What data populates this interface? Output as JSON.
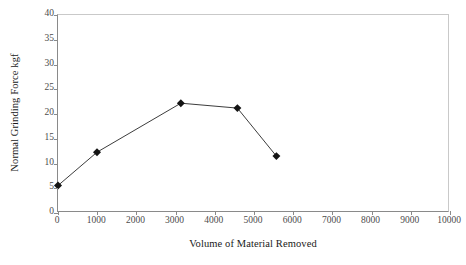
{
  "chart_data": {
    "type": "line",
    "title": "",
    "subtitle": "",
    "xlabel": "Volume of Material Removed",
    "ylabel": "Normal Grinding Force kgf",
    "xlim": [
      0,
      10000
    ],
    "ylim": [
      0,
      40
    ],
    "xticks": [
      0,
      1000,
      2000,
      3000,
      4000,
      5000,
      6000,
      7000,
      8000,
      9000,
      10000
    ],
    "yticks": [
      0,
      5,
      10,
      15,
      20,
      25,
      30,
      35,
      40
    ],
    "xtick_labels": [
      "0",
      "1000",
      "2000",
      "3000",
      "4000",
      "5000",
      "6000",
      "7000",
      "8000",
      "9000",
      "10000"
    ],
    "ytick_labels": [
      "0",
      "5",
      "10",
      "15",
      "20",
      "25",
      "30",
      "35",
      "40"
    ],
    "grid": false,
    "legend": false,
    "legend_position": "none",
    "marker": "diamond",
    "marker_color": "#141414",
    "line_color": "#3a3a3a",
    "axis_color": "#8a8a8a",
    "frame_color": "#c9c9c9",
    "background": "#ffffff",
    "series": [
      {
        "name": "Normal Grinding Force",
        "x": [
          0,
          1000,
          3150,
          4600,
          5600
        ],
        "y": [
          5.2,
          12.0,
          22.0,
          21.0,
          11.2
        ]
      }
    ]
  },
  "axes": {
    "x_title": "Volume of Material Removed",
    "y_title": "Normal Grinding Force kgf"
  }
}
